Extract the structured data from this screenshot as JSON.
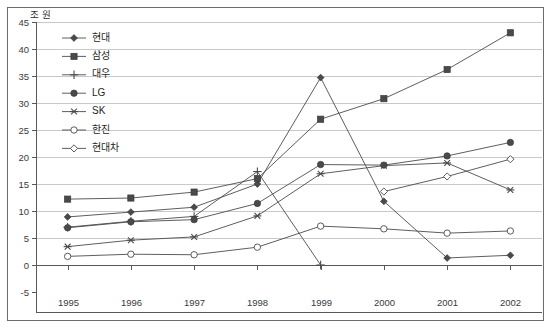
{
  "chart_data": {
    "type": "line",
    "title": "",
    "subtitle": "",
    "xlabel": "",
    "ylabel": "",
    "unit_label": "조 원",
    "x": [
      "1995",
      "1996",
      "1997",
      "1998",
      "1999",
      "2000",
      "2001",
      "2002"
    ],
    "categories": [
      "1995",
      "1996",
      "1997",
      "1998",
      "1999",
      "2000",
      "2001",
      "2002"
    ],
    "xlim": [
      0,
      7
    ],
    "ylim": [
      -5,
      45
    ],
    "y_ticks": [
      -5,
      0,
      5,
      10,
      15,
      20,
      25,
      30,
      35,
      40,
      45
    ],
    "y_tick_labels": [
      "-5",
      "0",
      "5",
      "10",
      "15",
      "20",
      "25",
      "30",
      "35",
      "40",
      "45"
    ],
    "grid": true,
    "grid_axis": "y",
    "legend_position": "top-left-inside",
    "series": [
      {
        "name": "현대",
        "marker": "filled-diamond",
        "values": [
          8.9,
          9.8,
          10.7,
          15.0,
          34.7,
          11.8,
          1.3,
          1.8
        ]
      },
      {
        "name": "삼성",
        "marker": "filled-square",
        "values": [
          12.2,
          12.4,
          13.5,
          16.0,
          27.0,
          30.8,
          36.2,
          43.0
        ]
      },
      {
        "name": "대우",
        "marker": "plus",
        "values": [
          7.0,
          8.1,
          9.0,
          17.3,
          0.0,
          null,
          null,
          null
        ]
      },
      {
        "name": "LG",
        "marker": "filled-circle",
        "values": [
          6.9,
          8.0,
          8.4,
          11.4,
          18.6,
          18.5,
          20.2,
          22.7
        ]
      },
      {
        "name": "SK",
        "marker": "asterisk",
        "values": [
          3.4,
          4.6,
          5.2,
          9.1,
          16.9,
          18.4,
          18.9,
          13.9
        ]
      },
      {
        "name": "한진",
        "marker": "open-circle",
        "values": [
          1.6,
          2.0,
          1.9,
          3.3,
          7.2,
          6.7,
          5.9,
          6.3
        ]
      },
      {
        "name": "현대차",
        "marker": "open-diamond",
        "values": [
          null,
          null,
          null,
          null,
          null,
          13.6,
          16.4,
          19.6
        ]
      }
    ]
  },
  "colors": {
    "background": "#ffffff",
    "axis": "#58585a",
    "grid": "#c9c9cb",
    "series": "#4a4a4c",
    "text": "#1f1f21"
  }
}
